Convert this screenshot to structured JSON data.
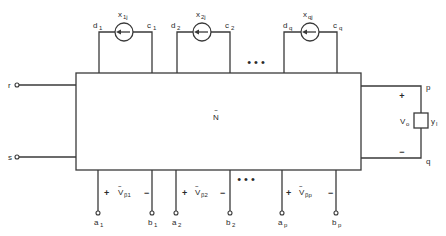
{
  "network": {
    "label": "N",
    "label_accent": "~"
  },
  "input_terminals": [
    {
      "label": "r"
    },
    {
      "label": "s"
    }
  ],
  "output_port": {
    "top_terminal": "p",
    "bottom_terminal": "q",
    "plus": "+",
    "minus": "−",
    "voltage_label": "V",
    "voltage_sub": "o",
    "load_label": "y",
    "load_sub": "l"
  },
  "current_sources": [
    {
      "label": "x",
      "sub": "1j",
      "left_node": "d",
      "left_sub": "1",
      "right_node": "c",
      "right_sub": "1"
    },
    {
      "label": "x",
      "sub": "2j",
      "left_node": "d",
      "left_sub": "2",
      "right_node": "c",
      "right_sub": "2"
    },
    {
      "label": "x",
      "sub": "qj",
      "left_node": "d",
      "left_sub": "q",
      "right_node": "c",
      "right_sub": "q"
    }
  ],
  "top_ellipsis": "• • •",
  "bottom_ellipsis": "• • •",
  "bottom_ports": [
    {
      "plus": "+",
      "minus": "−",
      "v_label": "V",
      "v_accent": "~",
      "v_sub": "β1",
      "a": "a",
      "a_sub": "1",
      "b": "b",
      "b_sub": "1"
    },
    {
      "plus": "+",
      "minus": "−",
      "v_label": "V",
      "v_accent": "~",
      "v_sub": "β2",
      "a": "a",
      "a_sub": "2",
      "b": "b",
      "b_sub": "2"
    },
    {
      "plus": "+",
      "minus": "−",
      "v_label": "V",
      "v_accent": "~",
      "v_sub": "βp",
      "a": "a",
      "a_sub": "p",
      "b": "b",
      "b_sub": "p"
    }
  ]
}
